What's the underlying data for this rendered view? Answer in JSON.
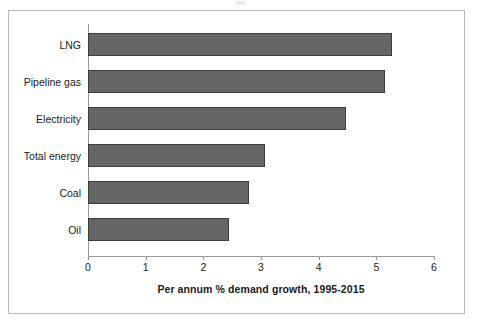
{
  "chart_data": {
    "type": "bar",
    "orientation": "horizontal",
    "title": "",
    "xlabel": "Per annum % demand growth, 1995-2015",
    "ylabel": "",
    "categories": [
      "LNG",
      "Pipeline gas",
      "Electricity",
      "Total energy",
      "Coal",
      "Oil"
    ],
    "values": [
      5.27,
      5.15,
      4.47,
      3.07,
      2.79,
      2.44
    ],
    "series": [
      {
        "name": "Per annum % demand growth, 1995-2015",
        "values": [
          5.27,
          5.15,
          4.47,
          3.07,
          2.79,
          2.44
        ]
      }
    ],
    "xlim": [
      0,
      6
    ],
    "xticks": [
      "0",
      "1",
      "2",
      "3",
      "4",
      "5",
      "6"
    ],
    "xtick_values": [
      0,
      1,
      2,
      3,
      4,
      5,
      6
    ],
    "grid": false,
    "legend": false,
    "legend_position": "none",
    "bar_color": "#666666",
    "bar_border_color": "#3d3d3d",
    "axis_color": "#9a9a9a",
    "frame_color": "#b8b8b8",
    "background_color": "#ffffff",
    "text_color": "#1a1a1a"
  },
  "axis": {
    "x_title": "Per annum % demand growth, 1995-2015",
    "ticks": [
      {
        "label": "0",
        "value": 0
      },
      {
        "label": "1",
        "value": 1
      },
      {
        "label": "2",
        "value": 2
      },
      {
        "label": "3",
        "value": 3
      },
      {
        "label": "4",
        "value": 4
      },
      {
        "label": "5",
        "value": 5
      },
      {
        "label": "6",
        "value": 6
      }
    ]
  },
  "bars": [
    {
      "label": "LNG",
      "value": 5.27
    },
    {
      "label": "Pipeline gas",
      "value": 5.15
    },
    {
      "label": "Electricity",
      "value": 4.47
    },
    {
      "label": "Total energy",
      "value": 3.07
    },
    {
      "label": "Coal",
      "value": 2.79
    },
    {
      "label": "Oil",
      "value": 2.44
    }
  ]
}
